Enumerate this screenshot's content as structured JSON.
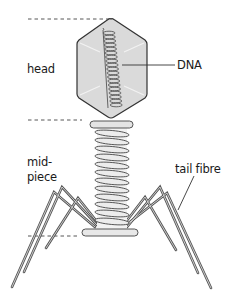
{
  "diagram": {
    "labels": {
      "head": "head",
      "dna": "DNA",
      "midpiece_line1": "mid-",
      "midpiece_line2": "piece",
      "tail_fibre": "tail fibre"
    },
    "colors": {
      "head_fill": "#d9d9d9",
      "outline": "#333333",
      "sheath_fill": "#e6e6e6",
      "leg": "#555555",
      "dashed": "#444444"
    }
  }
}
